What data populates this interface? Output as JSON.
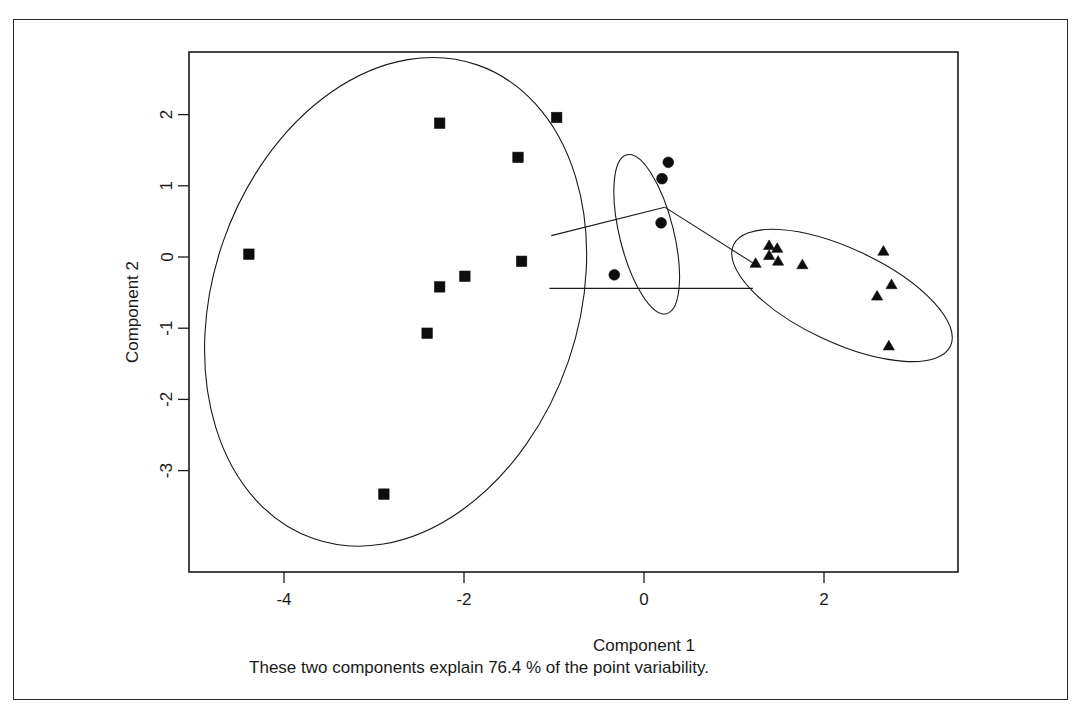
{
  "chart_data": {
    "type": "scatter",
    "title": "",
    "xlabel": "Component 1",
    "ylabel": "Component 2",
    "subtitle": "These two components explain 76.4 % of the point variability.",
    "variance_explained_pct": 76.4,
    "xlim": [
      -5.05,
      3.5
    ],
    "ylim": [
      -3.65,
      2.7
    ],
    "xticks": [
      -4,
      -2,
      0,
      2
    ],
    "xtick_labels": [
      "-4",
      "-2",
      "0",
      "2"
    ],
    "yticks": [
      2,
      1,
      0,
      -1,
      -2,
      -3
    ],
    "ytick_labels": [
      "2",
      "1",
      "0",
      "-1",
      "-2",
      "-3"
    ],
    "grid": false,
    "legend": "none",
    "series": [
      {
        "name": "Cluster 1",
        "marker": "square",
        "color": "#0d0d0d",
        "points": [
          {
            "x": -4.39,
            "y": 0.04
          },
          {
            "x": -2.27,
            "y": 1.88
          },
          {
            "x": -0.97,
            "y": 1.96
          },
          {
            "x": -1.4,
            "y": 1.4
          },
          {
            "x": -1.36,
            "y": -0.06
          },
          {
            "x": -1.99,
            "y": -0.27
          },
          {
            "x": -2.27,
            "y": -0.42
          },
          {
            "x": -2.41,
            "y": -1.07
          },
          {
            "x": -2.89,
            "y": -3.33
          }
        ]
      },
      {
        "name": "Cluster 2",
        "marker": "circle",
        "color": "#0d0d0d",
        "points": [
          {
            "x": 0.27,
            "y": 1.33
          },
          {
            "x": 0.2,
            "y": 1.1
          },
          {
            "x": 0.19,
            "y": 0.48
          },
          {
            "x": -0.33,
            "y": -0.25
          }
        ]
      },
      {
        "name": "Cluster 3",
        "marker": "triangle",
        "color": "#0d0d0d",
        "points": [
          {
            "x": 1.39,
            "y": 0.15
          },
          {
            "x": 1.48,
            "y": 0.11
          },
          {
            "x": 1.39,
            "y": 0.01
          },
          {
            "x": 1.49,
            "y": -0.07
          },
          {
            "x": 1.24,
            "y": -0.1
          },
          {
            "x": 1.76,
            "y": -0.12
          },
          {
            "x": 2.66,
            "y": 0.07
          },
          {
            "x": 2.75,
            "y": -0.4
          },
          {
            "x": 2.59,
            "y": -0.56
          },
          {
            "x": 2.72,
            "y": -1.26
          }
        ]
      }
    ],
    "ellipses": [
      {
        "name": "cluster-1-ellipse",
        "cx": -2.76,
        "cy": -0.63,
        "rx": 2.03,
        "ry": 3.52,
        "rotation_deg": 19
      },
      {
        "name": "cluster-2-ellipse",
        "cx": 0.03,
        "cy": 0.32,
        "rx": 0.3,
        "ry": 1.15,
        "rotation_deg": -14
      },
      {
        "name": "cluster-3-ellipse",
        "cx": 2.2,
        "cy": -0.54,
        "rx": 1.33,
        "ry": 0.66,
        "rotation_deg": 25
      }
    ],
    "connectors": [
      {
        "name": "link-cluster1-cluster2",
        "x1": -1.03,
        "y1": 0.3,
        "x2": 0.23,
        "y2": 0.7
      },
      {
        "name": "link-cluster2-cluster3",
        "x1": 0.23,
        "y1": 0.7,
        "x2": 1.23,
        "y2": -0.1
      },
      {
        "name": "link-cluster1-cluster3-baseline",
        "x1": -1.05,
        "y1": -0.44,
        "x2": 1.21,
        "y2": -0.44
      }
    ]
  },
  "axes": {
    "x_title": "Component 1",
    "y_title": "Component 2",
    "subtitle": "These two components explain 76.4 % of the point variability."
  },
  "ticks": {
    "x": [
      "-4",
      "-2",
      "0",
      "2"
    ],
    "y": [
      "2",
      "1",
      "0",
      "-1",
      "-2",
      "-3"
    ]
  }
}
